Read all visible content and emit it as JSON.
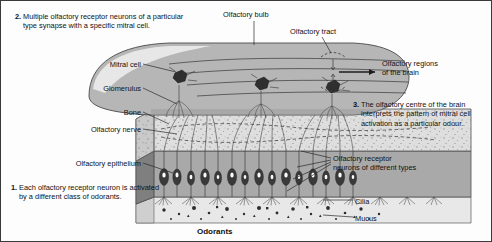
{
  "figure": {
    "caption": "Odorants"
  },
  "labels": {
    "olfactory_bulb": "Olfactory bulb",
    "olfactory_tract": "Olfactory tract",
    "olfactory_regions": "Olfactory regions\nof the brain",
    "mitral_cell": "Mitral cell",
    "glomerulus": "Glomerulus",
    "bone": "Bone",
    "olfactory_nerve": "Olfactory nerve",
    "olfactory_epithelium": "Olfactory epithelium",
    "receptor_neurons": "Olfactory receptor\nneurons of different types",
    "cilia": "Cilia",
    "mucus": "Mucus"
  },
  "steps": [
    {
      "number": "1.",
      "text": "Each olfactory receptor\nneuron is activated by\na different class of odorants."
    },
    {
      "number": "2.",
      "text": "Multiple olfactory receptor\nneurons of a particular type\nsynapse with a specific mitral cell."
    },
    {
      "number": "3.",
      "text": "The olfactory centre of the\nbrain interprets the pattern\nof mitral cell activation as a\nparticular odour."
    }
  ],
  "colors": {
    "bulb_fill": "#b4b4b4",
    "bulb_highlight": "#cfcfcf",
    "bone_fill": "#dcdcdc",
    "epithelium_fill": "#a8a8a8",
    "mucus_fill": "#e4e4e4",
    "outline": "#4a4a4a",
    "text": "#111111",
    "neuron_body": "#3c3c3c",
    "nucleus": "#ffffff"
  }
}
